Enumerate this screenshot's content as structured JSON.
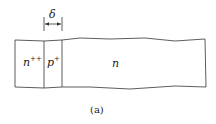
{
  "diagram": {
    "regions": [
      {
        "label": "n",
        "sup": "++"
      },
      {
        "label": "p",
        "sup": "+"
      },
      {
        "label": "n",
        "sup": ""
      }
    ],
    "dimension_label": "δ",
    "caption": "(a)"
  }
}
